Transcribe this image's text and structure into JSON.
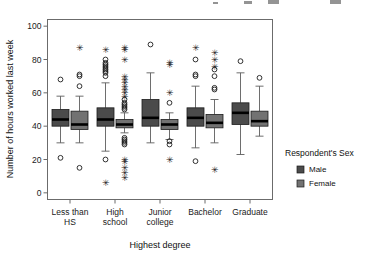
{
  "chart_data": {
    "type": "box",
    "title": "",
    "xlabel": "Highest degree",
    "ylabel": "Number of hours worked last week",
    "categories": [
      "Less than HS",
      "High school",
      "Junior college",
      "Bachelor",
      "Graduate"
    ],
    "category_lines": [
      [
        "Less than",
        "HS"
      ],
      [
        "High",
        "school"
      ],
      [
        "Junior",
        "college"
      ],
      [
        "Bachelor"
      ],
      [
        "Graduate"
      ]
    ],
    "ylim": [
      -4,
      104
    ],
    "yticks": [
      0,
      20,
      40,
      60,
      80,
      100
    ],
    "ytick_labels": [
      "0",
      "20",
      "40",
      "60",
      "80",
      "100"
    ],
    "grid": false,
    "legend": {
      "title": "Respondent's Sex",
      "position": "right",
      "entries": [
        {
          "label": "Male",
          "color": "#4b4b4b"
        },
        {
          "label": "Female",
          "color": "#727272"
        }
      ]
    },
    "series": [
      {
        "name": "Male",
        "color": "#4b4b4b",
        "boxes": [
          {
            "category": "Less than HS",
            "whisker_low": 30,
            "q1": 40,
            "median": 44,
            "q3": 50,
            "whisker_high": 58,
            "outliers_circle": [
              68,
              21
            ],
            "outliers_star": []
          },
          {
            "category": "High school",
            "whisker_low": 25,
            "q1": 40,
            "median": 44,
            "q3": 51,
            "whisker_high": 66,
            "outliers_circle": [
              80,
              78,
              77,
              76,
              75,
              74,
              73,
              72,
              70,
              20
            ],
            "outliers_star": [
              86,
              6
            ]
          },
          {
            "category": "Junior college",
            "whisker_low": 30,
            "q1": 40,
            "median": 45,
            "q3": 56,
            "whisker_high": 72,
            "outliers_circle": [
              89
            ],
            "outliers_star": []
          },
          {
            "category": "Bachelor",
            "whisker_low": 27,
            "q1": 40,
            "median": 45,
            "q3": 51,
            "whisker_high": 64,
            "outliers_circle": [
              80,
              71,
              70,
              19
            ],
            "outliers_star": [
              87
            ]
          },
          {
            "category": "Graduate",
            "whisker_low": 23,
            "q1": 41,
            "median": 48,
            "q3": 54,
            "whisker_high": 72,
            "outliers_circle": [
              79
            ],
            "outliers_star": []
          }
        ]
      },
      {
        "name": "Female",
        "color": "#727272",
        "boxes": [
          {
            "category": "Less than HS",
            "whisker_low": 30,
            "q1": 38,
            "median": 41,
            "q3": 49,
            "whisker_high": 58,
            "outliers_circle": [
              71,
              70,
              64,
              15
            ],
            "outliers_star": [
              87
            ]
          },
          {
            "category": "High school",
            "whisker_low": 36,
            "q1": 39,
            "median": 41,
            "q3": 44,
            "whisker_high": 48,
            "outliers_circle": [
              56,
              54,
              53,
              52,
              51,
              50,
              33,
              32,
              31,
              30,
              29
            ],
            "outliers_star": [
              87,
              86,
              80,
              70,
              68,
              66,
              64,
              62,
              60,
              58,
              20,
              19,
              15,
              12,
              9
            ]
          },
          {
            "category": "Junior college",
            "whisker_low": 32,
            "q1": 38,
            "median": 41,
            "q3": 44,
            "whisker_high": 48,
            "outliers_circle": [
              54,
              31,
              29
            ],
            "outliers_star": [
              78,
              77,
              60,
              20
            ]
          },
          {
            "category": "Bachelor",
            "whisker_low": 30,
            "q1": 39,
            "median": 42,
            "q3": 47,
            "whisker_high": 56,
            "outliers_circle": [
              74,
              70,
              63,
              62
            ],
            "outliers_star": [
              84,
              80,
              76,
              14
            ]
          },
          {
            "category": "Graduate",
            "whisker_low": 34,
            "q1": 40,
            "median": 43,
            "q3": 49,
            "whisker_high": 64,
            "outliers_circle": [
              69
            ],
            "outliers_star": []
          }
        ]
      }
    ]
  }
}
